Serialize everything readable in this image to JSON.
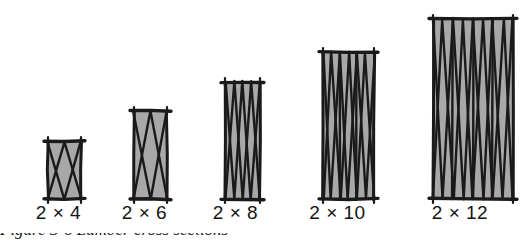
{
  "figure": {
    "kind": "technical-illustration",
    "background_color": "#ffffff",
    "fill_color": "#a8a8a8",
    "stroke_color": "#1a1a1a",
    "panel_count": 5,
    "baseline_y": 192,
    "common_width_label": "2"
  },
  "panels": [
    {
      "id": "panel-2x4",
      "label": "2 × 4",
      "nominal_width": 2,
      "nominal_depth": 4,
      "x": 42,
      "y": 135,
      "w": 33,
      "h": 58,
      "crossings": 1,
      "label_x": 22,
      "label_y": 203
    },
    {
      "id": "panel-2x6",
      "label": "2 × 6",
      "nominal_width": 2,
      "nominal_depth": 6,
      "x": 128,
      "y": 105,
      "w": 33,
      "h": 88,
      "crossings": 1,
      "label_x": 108,
      "label_y": 203
    },
    {
      "id": "panel-2x8",
      "label": "2 × 8",
      "nominal_width": 2,
      "nominal_depth": 8,
      "x": 219,
      "y": 76,
      "w": 35,
      "h": 117,
      "crossings": 2,
      "label_x": 198,
      "label_y": 203
    },
    {
      "id": "panel-2x10",
      "label": "2 × 10",
      "nominal_width": 2,
      "nominal_depth": 10,
      "x": 317,
      "y": 46,
      "w": 51,
      "h": 147,
      "crossings": 3,
      "label_x": 292,
      "label_y": 203
    },
    {
      "id": "panel-2x12",
      "label": "2 × 12",
      "nominal_width": 2,
      "nominal_depth": 12,
      "x": 427,
      "y": 13,
      "w": 80,
      "h": 180,
      "crossings": 4,
      "label_x": 400,
      "label_y": 203
    }
  ],
  "caption": {
    "visible_fragment": true,
    "text": "Figure 3-6   Lumber cross sections"
  }
}
